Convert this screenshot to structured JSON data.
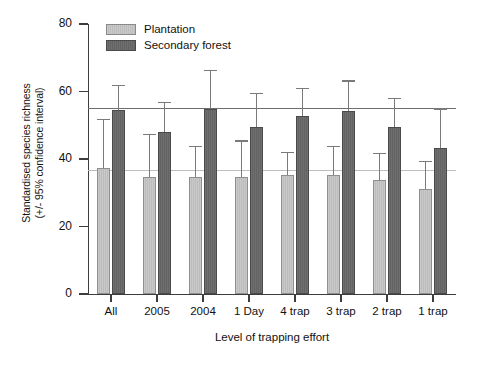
{
  "chart_data": {
    "type": "bar",
    "title": "",
    "subtitle": "",
    "xlabel": "Level of trapping effort",
    "ylabel_line1": "Standardised species richness",
    "ylabel_line2": "(+/- 95% confidence interval)",
    "categories": [
      "All",
      "2005",
      "2004",
      "1 Day",
      "4 trap",
      "3 trap",
      "2 trap",
      "1 trap"
    ],
    "ylim": [
      0,
      80
    ],
    "yticks": [
      0,
      20,
      40,
      60,
      80
    ],
    "ytick_labels": [
      "0",
      "20",
      "40",
      "60",
      "80"
    ],
    "grid": false,
    "legend_position": "top-left",
    "series": [
      {
        "name": "Plantation",
        "color": "#c3c3c3",
        "values": [
          37.4,
          34.6,
          34.8,
          34.8,
          35.4,
          35.3,
          33.8,
          31.0
        ],
        "ci_upper": [
          51.8,
          47.5,
          44.0,
          45.5,
          42.2,
          44.0,
          41.8,
          39.5
        ],
        "ci_lower": [
          23.0,
          21.7,
          25.6,
          24.1,
          28.6,
          26.6,
          25.8,
          22.5
        ]
      },
      {
        "name": "Secondary forest",
        "color": "#6a6a6a",
        "values": [
          54.6,
          48.0,
          54.8,
          49.6,
          52.7,
          54.1,
          49.5,
          43.4
        ],
        "ci_upper": [
          62.0,
          57.0,
          66.5,
          59.5,
          61.0,
          63.3,
          58.0,
          55.0
        ],
        "ci_lower": [
          47.2,
          39.0,
          43.1,
          39.7,
          44.4,
          44.9,
          41.0,
          31.8
        ]
      }
    ],
    "reference_lines": [
      {
        "name": "secondary-forest-reference",
        "value": 55.0,
        "color": "#6e6e6e"
      },
      {
        "name": "plantation-reference",
        "value": 36.5,
        "color": "#bdbdbd"
      }
    ]
  },
  "legend": {
    "items": [
      {
        "label": "Plantation",
        "swatch": "plantation-swatch"
      },
      {
        "label": "Secondary forest",
        "swatch": "secondary-forest-swatch"
      }
    ]
  }
}
